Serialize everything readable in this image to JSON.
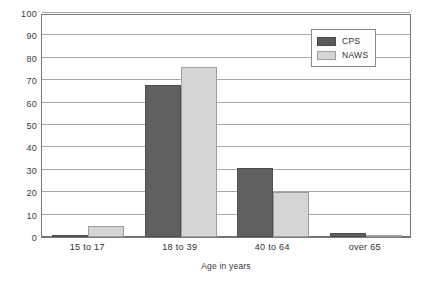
{
  "chart_data": {
    "type": "bar",
    "title": "",
    "subtitle": "",
    "xlabel": "Age in years",
    "ylabel": "",
    "categories": [
      "15 to 17",
      "18 to 39",
      "40 to 64",
      "over 65"
    ],
    "series": [
      {
        "name": "CPS",
        "color": "#606060",
        "values": [
          1,
          68,
          31,
          2
        ]
      },
      {
        "name": "NAWS",
        "color": "#d5d5d5",
        "values": [
          5,
          76,
          20,
          1
        ]
      }
    ],
    "ylim": [
      0,
      100
    ],
    "yticks": [
      0,
      10,
      20,
      30,
      40,
      50,
      60,
      70,
      80,
      90,
      100
    ],
    "ytick_labels": [
      "0",
      "10",
      "20",
      "30",
      "40",
      "50",
      "60",
      "70",
      "80",
      "90",
      "100"
    ],
    "grid": true,
    "grid_axis": "y",
    "legend_position": "top-right",
    "legend_entries": [
      "CPS",
      "NAWS"
    ],
    "annotations": []
  },
  "legend": {
    "items": [
      {
        "label": "CPS",
        "swatch": "legend-swatch-cps"
      },
      {
        "label": "NAWS",
        "swatch": "legend-swatch-naws"
      }
    ]
  }
}
